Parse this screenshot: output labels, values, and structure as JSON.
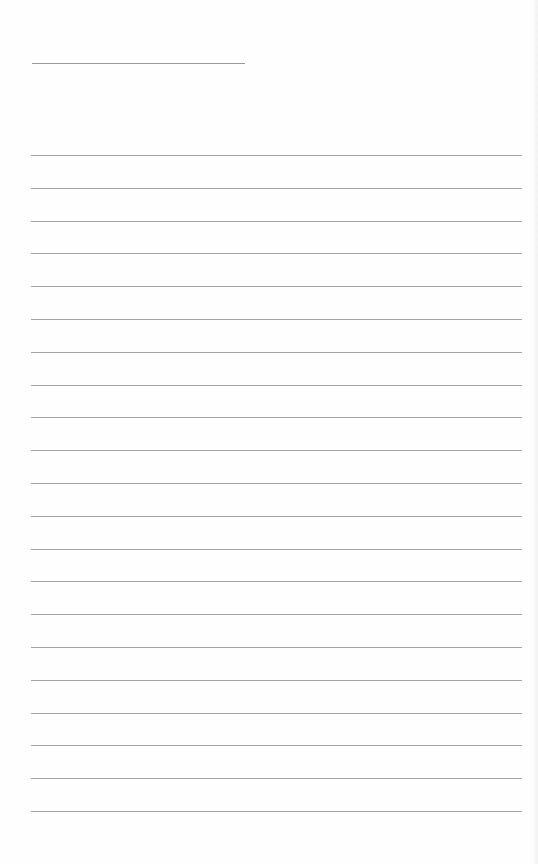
{
  "page": {
    "type": "blank ruled sheet",
    "background_color": "#fefefe",
    "line_color": "#a4a4a4",
    "title_line": {
      "x": 32,
      "y": 63,
      "width": 213
    },
    "rules": {
      "x": 31,
      "width": 491,
      "first_y": 155,
      "spacing": 32.8,
      "count": 21
    }
  }
}
